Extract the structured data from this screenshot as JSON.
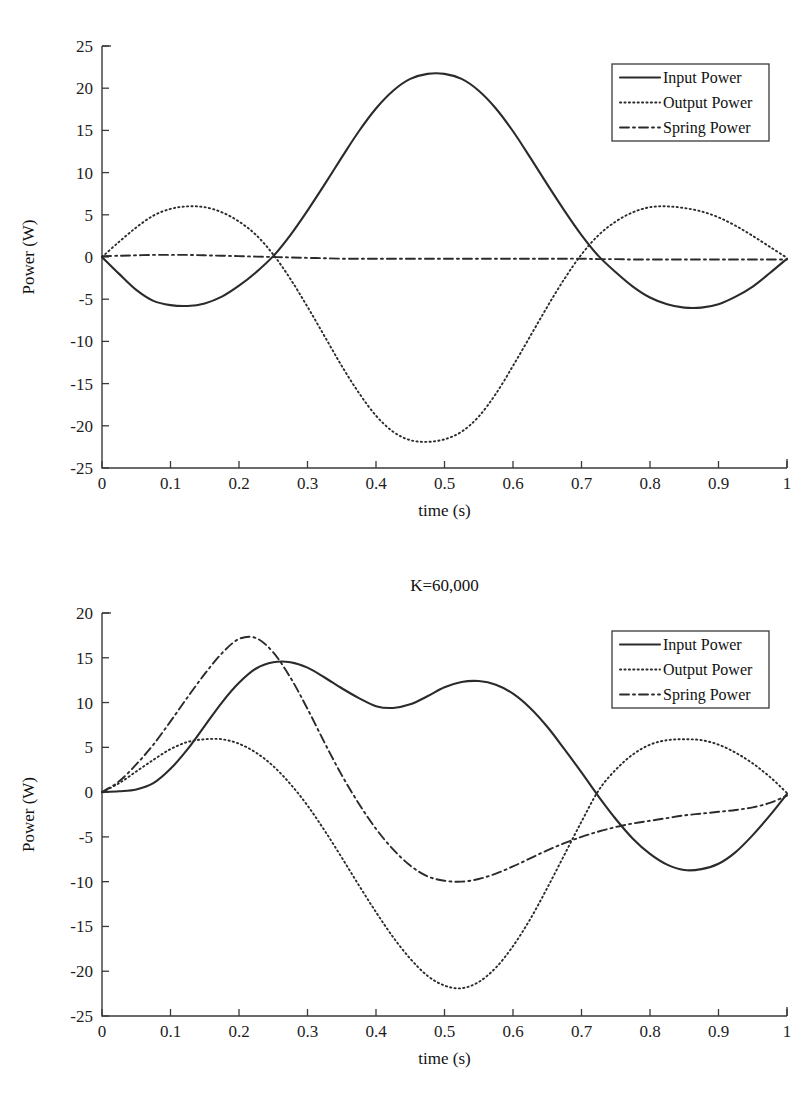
{
  "figures": [
    {
      "name": "power-chart-top",
      "chart_data": {
        "type": "line",
        "title": "",
        "xlabel": "time (s)",
        "ylabel": "Power (W)",
        "xlim": [
          0,
          1
        ],
        "ylim": [
          -25,
          25
        ],
        "xticks": [
          "0",
          "0.1",
          "0.2",
          "0.3",
          "0.4",
          "0.5",
          "0.6",
          "0.7",
          "0.8",
          "0.9",
          "1"
        ],
        "xtick_values": [
          0,
          0.1,
          0.2,
          0.3,
          0.4,
          0.5,
          0.6,
          0.7,
          0.8,
          0.9,
          1
        ],
        "yticks": [
          "25",
          "20",
          "15",
          "10",
          "5",
          "0",
          "-5",
          "-10",
          "-15",
          "-20",
          "-25"
        ],
        "ytick_values": [
          25,
          20,
          15,
          10,
          5,
          0,
          -5,
          -10,
          -15,
          -20,
          -25
        ],
        "grid": false,
        "legend_position": "top-right",
        "x": [
          0,
          0.025,
          0.05,
          0.075,
          0.1,
          0.125,
          0.15,
          0.175,
          0.2,
          0.225,
          0.25,
          0.275,
          0.3,
          0.325,
          0.35,
          0.375,
          0.4,
          0.425,
          0.45,
          0.475,
          0.5,
          0.525,
          0.55,
          0.575,
          0.6,
          0.625,
          0.65,
          0.675,
          0.7,
          0.725,
          0.75,
          0.775,
          0.8,
          0.825,
          0.85,
          0.875,
          0.9,
          0.925,
          0.95,
          0.975,
          1
        ],
        "series": [
          {
            "name": "Input Power",
            "style": "solid",
            "values": [
              0,
              -2.0,
              -3.9,
              -5.2,
              -5.7,
              -5.8,
              -5.5,
              -4.7,
              -3.4,
              -1.8,
              0.1,
              2.6,
              5.5,
              8.6,
              11.8,
              14.9,
              17.6,
              19.7,
              21.1,
              21.7,
              21.7,
              21.1,
              19.7,
              17.6,
              14.9,
              11.8,
              8.6,
              5.5,
              2.6,
              0.1,
              -1.8,
              -3.5,
              -4.8,
              -5.6,
              -6.0,
              -6.0,
              -5.6,
              -4.7,
              -3.5,
              -1.9,
              -0.2
            ]
          },
          {
            "name": "Output Power",
            "style": "dotted",
            "values": [
              0,
              1.8,
              3.5,
              4.9,
              5.7,
              6.0,
              5.9,
              5.3,
              4.2,
              2.6,
              0.3,
              -2.6,
              -5.9,
              -9.4,
              -12.9,
              -16.1,
              -18.8,
              -20.7,
              -21.7,
              -21.9,
              -21.6,
              -20.7,
              -18.9,
              -16.2,
              -12.9,
              -9.4,
              -5.9,
              -2.6,
              0.3,
              2.6,
              4.2,
              5.3,
              5.9,
              6.0,
              5.8,
              5.4,
              4.7,
              3.7,
              2.5,
              1.2,
              -0.1
            ]
          },
          {
            "name": "Spring Power",
            "style": "dashdot",
            "values": [
              0.1,
              0.15,
              0.2,
              0.25,
              0.25,
              0.25,
              0.2,
              0.15,
              0.1,
              0.05,
              0.0,
              -0.05,
              -0.1,
              -0.15,
              -0.2,
              -0.2,
              -0.2,
              -0.2,
              -0.2,
              -0.2,
              -0.2,
              -0.2,
              -0.2,
              -0.2,
              -0.2,
              -0.2,
              -0.2,
              -0.2,
              -0.2,
              -0.25,
              -0.25,
              -0.3,
              -0.3,
              -0.3,
              -0.3,
              -0.3,
              -0.3,
              -0.3,
              -0.3,
              -0.3,
              -0.3
            ]
          }
        ],
        "legend": [
          "Input Power",
          "Output Power",
          "Spring Power"
        ]
      }
    },
    {
      "name": "power-chart-bottom",
      "chart_data": {
        "type": "line",
        "title": "K=60,000",
        "xlabel": "time (s)",
        "ylabel": "Power (W)",
        "xlim": [
          0,
          1
        ],
        "ylim": [
          -25,
          20
        ],
        "xticks": [
          "0",
          "0.1",
          "0.2",
          "0.3",
          "0.4",
          "0.5",
          "0.6",
          "0.7",
          "0.8",
          "0.9",
          "1"
        ],
        "xtick_values": [
          0,
          0.1,
          0.2,
          0.3,
          0.4,
          0.5,
          0.6,
          0.7,
          0.8,
          0.9,
          1
        ],
        "yticks": [
          "20",
          "15",
          "10",
          "5",
          "0",
          "-5",
          "-10",
          "-15",
          "-20",
          "-25"
        ],
        "ytick_values": [
          20,
          15,
          10,
          5,
          0,
          -5,
          -10,
          -15,
          -20,
          -25
        ],
        "grid": false,
        "legend_position": "top-right",
        "x": [
          0,
          0.025,
          0.05,
          0.075,
          0.1,
          0.125,
          0.15,
          0.175,
          0.2,
          0.225,
          0.25,
          0.275,
          0.3,
          0.325,
          0.35,
          0.375,
          0.4,
          0.425,
          0.45,
          0.475,
          0.5,
          0.525,
          0.55,
          0.575,
          0.6,
          0.625,
          0.65,
          0.675,
          0.7,
          0.725,
          0.75,
          0.775,
          0.8,
          0.825,
          0.85,
          0.875,
          0.9,
          0.925,
          0.95,
          0.975,
          1
        ],
        "series": [
          {
            "name": "Input Power",
            "style": "solid",
            "values": [
              0,
              0.1,
              0.3,
              1.0,
              2.6,
              4.8,
              7.4,
              10.0,
              12.2,
              13.8,
              14.5,
              14.5,
              13.9,
              12.8,
              11.6,
              10.5,
              9.6,
              9.4,
              9.8,
              10.7,
              11.7,
              12.3,
              12.4,
              12.0,
              11.0,
              9.4,
              7.3,
              4.8,
              2.2,
              -0.5,
              -3.0,
              -5.2,
              -6.9,
              -8.1,
              -8.7,
              -8.6,
              -8.0,
              -6.7,
              -4.8,
              -2.6,
              -0.2
            ]
          },
          {
            "name": "Output Power",
            "style": "dotted",
            "values": [
              0,
              1.0,
              2.3,
              3.6,
              4.8,
              5.6,
              5.9,
              5.9,
              5.4,
              4.4,
              2.9,
              0.9,
              -1.5,
              -4.3,
              -7.3,
              -10.4,
              -13.4,
              -16.2,
              -18.6,
              -20.5,
              -21.6,
              -21.9,
              -21.2,
              -19.6,
              -17.2,
              -14.2,
              -10.7,
              -7.0,
              -3.3,
              0.2,
              2.5,
              4.2,
              5.3,
              5.8,
              5.9,
              5.8,
              5.3,
              4.4,
              3.2,
              1.7,
              -0.1
            ]
          },
          {
            "name": "Spring Power",
            "style": "dashdot",
            "values": [
              0,
              1.2,
              3.1,
              5.3,
              7.9,
              10.6,
              13.2,
              15.5,
              17.1,
              17.2,
              15.6,
              12.8,
              9.3,
              5.5,
              1.9,
              -1.3,
              -4.1,
              -6.4,
              -8.2,
              -9.4,
              -9.9,
              -10.0,
              -9.7,
              -9.1,
              -8.3,
              -7.4,
              -6.5,
              -5.7,
              -5.0,
              -4.4,
              -3.9,
              -3.5,
              -3.2,
              -2.9,
              -2.6,
              -2.4,
              -2.2,
              -2.0,
              -1.7,
              -1.2,
              -0.4
            ]
          }
        ],
        "legend": [
          "Input Power",
          "Output Power",
          "Spring Power"
        ]
      }
    }
  ]
}
